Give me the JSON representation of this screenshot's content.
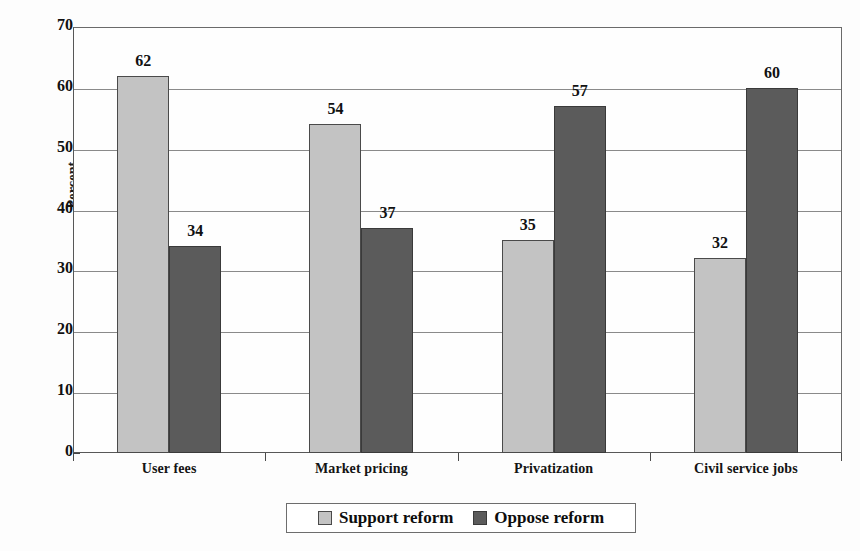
{
  "chart_data": {
    "type": "bar",
    "title": "",
    "subtitle": "",
    "xlabel": "",
    "ylabel": "Percent",
    "ylim": [
      0,
      70
    ],
    "yticks": [
      0,
      10,
      20,
      30,
      40,
      50,
      60,
      70
    ],
    "ytick_labels": [
      "0",
      "10",
      "20",
      "30",
      "40",
      "50",
      "60",
      "70"
    ],
    "grid": true,
    "grid_axis": "y",
    "legend_position": "bottom",
    "categories": [
      "User fees",
      "Market pricing",
      "Privatization",
      "Civil service jobs"
    ],
    "series": [
      {
        "name": "Support reform",
        "color": "#c3c3c3",
        "values": [
          62,
          54,
          35,
          32
        ],
        "value_labels": [
          "62",
          "54",
          "35",
          "32"
        ]
      },
      {
        "name": "Oppose reform",
        "color": "#5b5b5b",
        "values": [
          34,
          37,
          57,
          60
        ],
        "value_labels": [
          "34",
          "37",
          "57",
          "60"
        ]
      }
    ]
  },
  "legend": {
    "entries": [
      {
        "label": "Support reform",
        "swatch": "support-swatch-icon"
      },
      {
        "label": "Oppose reform",
        "swatch": "oppose-swatch-icon"
      }
    ]
  },
  "colors": {
    "support_fill": "#c3c3c3",
    "oppose_fill": "#5b5b5b",
    "bar_border": "#4a4a4a",
    "gridline": "#8a8a8a",
    "axis": "#575757",
    "text": "#111111",
    "background": "#fdfdfd"
  }
}
